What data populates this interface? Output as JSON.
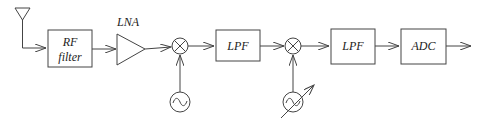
{
  "diagram": {
    "blocks": [
      {
        "id": "antenna",
        "label": ""
      },
      {
        "id": "rf_filter",
        "label_line1": "RF",
        "label_line2": "filter"
      },
      {
        "id": "lna",
        "label": "LNA"
      },
      {
        "id": "mixer1",
        "label": ""
      },
      {
        "id": "osc1",
        "label": ""
      },
      {
        "id": "lpf1",
        "label": "LPF"
      },
      {
        "id": "mixer2",
        "label": ""
      },
      {
        "id": "osc2_tunable",
        "label": ""
      },
      {
        "id": "lpf2",
        "label": "LPF"
      },
      {
        "id": "adc",
        "label": "ADC"
      }
    ],
    "connections": [
      [
        "antenna",
        "rf_filter"
      ],
      [
        "rf_filter",
        "lna"
      ],
      [
        "lna",
        "mixer1"
      ],
      [
        "osc1",
        "mixer1"
      ],
      [
        "mixer1",
        "lpf1"
      ],
      [
        "lpf1",
        "mixer2"
      ],
      [
        "osc2_tunable",
        "mixer2"
      ],
      [
        "mixer2",
        "lpf2"
      ],
      [
        "lpf2",
        "adc"
      ],
      [
        "adc",
        "output"
      ]
    ],
    "colors": {
      "stroke": "#444444",
      "text": "#222222",
      "background": "#ffffff"
    }
  }
}
